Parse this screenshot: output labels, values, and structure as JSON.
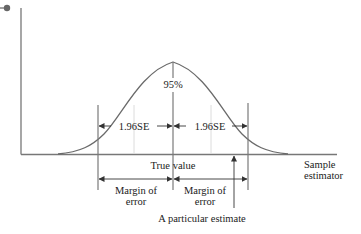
{
  "diagram": {
    "colors": {
      "axis": "#777777",
      "curve": "#6a6a6a",
      "line": "#7a7a7a",
      "light_line": "#d8d8d8",
      "dot": "#666666",
      "text": "#222222"
    },
    "labels": {
      "percent": "95%",
      "se_left": "1.96SE",
      "se_right": "1.96SE",
      "true_value": "True value",
      "margin_left_1": "Margin of",
      "margin_left_2": "error",
      "margin_right_1": "Margin of",
      "margin_right_2": "error",
      "particular_estimate": "A particular estimate",
      "sample_estimator_1": "Sample",
      "sample_estimator_2": "estimator"
    }
  }
}
